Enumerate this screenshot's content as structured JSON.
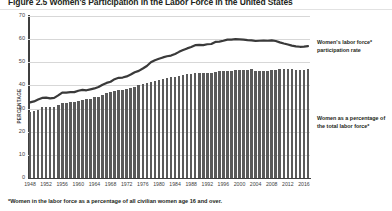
{
  "figure": {
    "title": "Figure 2.5  Women's Participation in the Labor Force in the United States",
    "footnote": "*Women in the labor force as a percentage of all civilian women age 16 and over."
  },
  "annotations": {
    "line_label": "Women's labor force* participation rate",
    "bars_label": "Women as a percentage of the total labor force*"
  },
  "axes": {
    "ylabel": "PERCENTAGE",
    "yticks": [
      0,
      10,
      20,
      30,
      40,
      50,
      60,
      70
    ],
    "xticks": [
      1948,
      1952,
      1956,
      1960,
      1964,
      1968,
      1972,
      1976,
      1980,
      1984,
      1988,
      1992,
      1996,
      2000,
      2004,
      2008,
      2012,
      2016
    ]
  },
  "colors": {
    "bar": "#5a5a5a",
    "line": "#3a3a3a",
    "grid": "#d7d7d7",
    "axis": "#3f3f3f",
    "text": "#231f20"
  },
  "chart_data": {
    "type": "bar",
    "title": "Figure 2.5  Women's Participation in the Labor Force in the United States",
    "xlabel": "",
    "ylabel": "PERCENTAGE",
    "ylim": [
      0,
      70
    ],
    "grid": true,
    "legend": "annotations at right",
    "x": [
      1948,
      1949,
      1950,
      1951,
      1952,
      1953,
      1954,
      1955,
      1956,
      1957,
      1958,
      1959,
      1960,
      1961,
      1962,
      1963,
      1964,
      1965,
      1966,
      1967,
      1968,
      1969,
      1970,
      1971,
      1972,
      1973,
      1974,
      1975,
      1976,
      1977,
      1978,
      1979,
      1980,
      1981,
      1982,
      1983,
      1984,
      1985,
      1986,
      1987,
      1988,
      1989,
      1990,
      1991,
      1992,
      1993,
      1994,
      1995,
      1996,
      1997,
      1998,
      1999,
      2000,
      2001,
      2002,
      2003,
      2004,
      2005,
      2006,
      2007,
      2008,
      2009,
      2010,
      2011,
      2012,
      2013,
      2014,
      2015,
      2016,
      2017
    ],
    "series": [
      {
        "name": "Women as a percentage of the total labor force*",
        "render": "bar",
        "values": [
          28.6,
          28.9,
          29.6,
          30.5,
          30.8,
          30.8,
          30.9,
          31.6,
          32.2,
          32.5,
          32.7,
          32.9,
          33.4,
          33.8,
          34.0,
          34.3,
          34.8,
          35.2,
          36.0,
          36.7,
          37.1,
          37.8,
          38.1,
          38.2,
          38.5,
          38.9,
          39.4,
          40.0,
          40.5,
          41.0,
          41.7,
          42.1,
          42.5,
          43.0,
          43.3,
          43.7,
          43.8,
          44.2,
          44.5,
          44.8,
          45.0,
          45.2,
          45.2,
          45.4,
          45.5,
          45.5,
          46.0,
          46.1,
          46.2,
          46.2,
          46.3,
          46.5,
          46.5,
          46.6,
          46.6,
          47.0,
          46.4,
          46.4,
          46.3,
          46.4,
          46.5,
          46.8,
          47.2,
          47.0,
          47.0,
          46.9,
          46.8,
          46.8,
          46.8,
          46.9
        ]
      },
      {
        "name": "Women's labor force* participation rate",
        "render": "line",
        "values": [
          32.7,
          33.1,
          33.9,
          34.6,
          34.7,
          34.4,
          34.6,
          35.7,
          36.9,
          36.9,
          37.1,
          37.1,
          37.7,
          38.1,
          37.9,
          38.3,
          38.7,
          39.3,
          40.3,
          41.1,
          41.6,
          42.7,
          43.3,
          43.4,
          43.9,
          44.7,
          45.7,
          46.3,
          47.3,
          48.4,
          50.0,
          50.9,
          51.5,
          52.1,
          52.6,
          52.9,
          53.6,
          54.5,
          55.3,
          56.0,
          56.6,
          57.4,
          57.5,
          57.4,
          57.8,
          57.9,
          58.8,
          58.9,
          59.3,
          59.8,
          59.8,
          60.0,
          59.9,
          59.8,
          59.6,
          59.5,
          59.2,
          59.3,
          59.4,
          59.3,
          59.5,
          59.2,
          58.6,
          58.1,
          57.7,
          57.2,
          56.9,
          56.7,
          56.8,
          57.0
        ]
      }
    ]
  }
}
